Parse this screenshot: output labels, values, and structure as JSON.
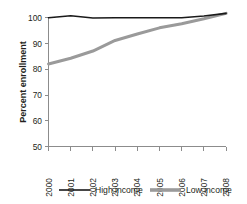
{
  "chart_data": {
    "type": "line",
    "title": "",
    "subtitle": "",
    "xlabel": "",
    "ylabel": "Percent enrollment",
    "x": [
      2000,
      2001,
      2002,
      2003,
      2004,
      2005,
      2006,
      2007,
      2008
    ],
    "categories": [
      "2000",
      "2001",
      "2002",
      "2003",
      "2004",
      "2005",
      "2006",
      "2007",
      "2008"
    ],
    "series": [
      {
        "name": "High income",
        "color": "#1a1a1a",
        "stroke_width": 1.6,
        "values": [
          99.9,
          100.7,
          99.8,
          99.9,
          99.9,
          99.9,
          99.9,
          100.6,
          101.6
        ]
      },
      {
        "name": "Low income",
        "color": "#9a9a9a",
        "stroke_width": 3.0,
        "values": [
          82.0,
          84.2,
          87.0,
          91.1,
          93.6,
          96.0,
          97.6,
          99.5,
          101.6
        ]
      }
    ],
    "ylim": [
      50,
      102
    ],
    "yticks": [
      50,
      60,
      70,
      80,
      90,
      100
    ],
    "ytick_labels": [
      "50",
      "60",
      "70",
      "80",
      "90",
      "100"
    ],
    "xlim": [
      2000,
      2008
    ],
    "xticks": [
      2000,
      2001,
      2002,
      2003,
      2004,
      2005,
      2006,
      2007,
      2008
    ],
    "grid": false,
    "legend_position": "bottom",
    "legend": [
      "High income",
      "Low income"
    ]
  },
  "axes": {
    "y_title": "Percent enrollment"
  },
  "legend": {
    "items": [
      {
        "label": "High income"
      },
      {
        "label": "Low income"
      }
    ]
  }
}
